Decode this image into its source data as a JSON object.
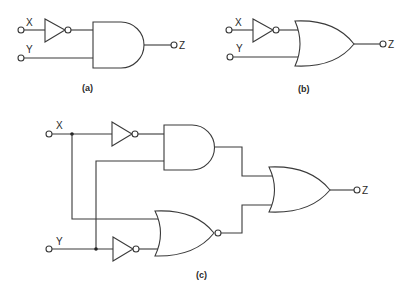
{
  "diagram": {
    "type": "logic-circuit-figure",
    "colors": {
      "line": "#3a3a3a",
      "background": "#ffffff",
      "text": "#2a2a2a"
    },
    "panels": [
      {
        "caption": "(a)",
        "inputs": [
          "X",
          "Y"
        ],
        "output": "Z",
        "gates": [
          "NOT (on X)",
          "AND"
        ],
        "expression": "Z = X' · Y"
      },
      {
        "caption": "(b)",
        "inputs": [
          "X",
          "Y"
        ],
        "output": "Z",
        "gates": [
          "NOT (on X)",
          "OR"
        ],
        "expression": "Z = X' + Y"
      },
      {
        "caption": "(c)",
        "inputs": [
          "X",
          "Y"
        ],
        "output": "Z",
        "gates": [
          "NOT (on X)",
          "AND",
          "NOT (on Y)",
          "NOR",
          "OR"
        ],
        "expression": "Z = X'·Y + (X + Y')'"
      }
    ]
  },
  "labels": {
    "a": {
      "x": "X",
      "y": "Y",
      "z": "Z",
      "caption": "(a)"
    },
    "b": {
      "x": "X",
      "y": "Y",
      "z": "Z",
      "caption": "(b)"
    },
    "c": {
      "x": "X",
      "y": "Y",
      "z": "Z",
      "caption": "(c)"
    }
  }
}
